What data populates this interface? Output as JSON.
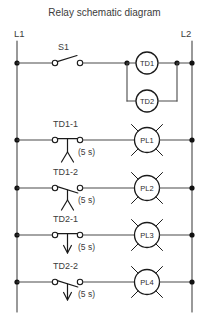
{
  "title": "Relay schematic diagram",
  "rails": {
    "left_label": "L1",
    "right_label": "L2"
  },
  "colors": {
    "background": "#ffffff",
    "wire": "#4a4a4a",
    "symbol": "#1a1a1a",
    "text": "#3c3c3c",
    "node": "#111111"
  },
  "delay_label": "(5 s)",
  "rungs": [
    {
      "index": 1,
      "switch_label": "S1",
      "switch_type": "normally-open-toggle-switch",
      "contact_label": "",
      "delay": "",
      "loads": [
        {
          "label": "TD1",
          "type": "timer-coil"
        },
        {
          "label": "TD2",
          "type": "timer-coil"
        }
      ]
    },
    {
      "index": 2,
      "switch_label": "",
      "switch_type": "",
      "contact_label": "TD1-1",
      "contact_type": "normally-open-timed-closed",
      "arrow": "tent-up",
      "delay": "(5 s)",
      "loads": [
        {
          "label": "PL1",
          "type": "pilot-lamp"
        }
      ]
    },
    {
      "index": 3,
      "switch_label": "",
      "switch_type": "",
      "contact_label": "TD1-2",
      "contact_type": "normally-closed-timed-open",
      "arrow": "tent-up",
      "delay": "(5 s)",
      "loads": [
        {
          "label": "PL2",
          "type": "pilot-lamp"
        }
      ]
    },
    {
      "index": 4,
      "switch_label": "",
      "switch_type": "",
      "contact_label": "TD2-1",
      "contact_type": "normally-open-timed-open",
      "arrow": "arrow-down",
      "delay": "(5 s)",
      "loads": [
        {
          "label": "PL3",
          "type": "pilot-lamp"
        }
      ]
    },
    {
      "index": 5,
      "switch_label": "",
      "switch_type": "",
      "contact_label": "TD2-2",
      "contact_type": "normally-closed-timed-closed",
      "arrow": "arrow-down",
      "delay": "(5 s)",
      "loads": [
        {
          "label": "PL4",
          "type": "pilot-lamp"
        }
      ]
    }
  ]
}
